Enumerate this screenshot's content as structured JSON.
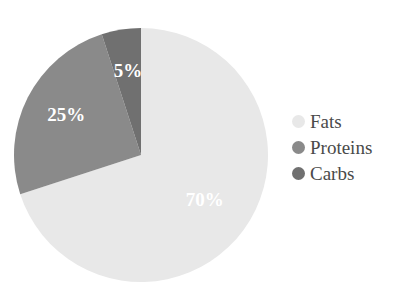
{
  "chart_data": {
    "type": "pie",
    "title": "",
    "labels": [
      "Fats",
      "Proteins",
      "Carbs"
    ],
    "values": [
      70,
      25,
      5
    ],
    "value_labels": [
      "70%",
      "25%",
      "5%"
    ],
    "colors": [
      "#e8e8e8",
      "#8a8a8a",
      "#707070"
    ],
    "start_angle_deg": 0,
    "direction": "clockwise",
    "legend_position": "right",
    "grid": false,
    "geometry": {
      "center_x": 141,
      "center_y": 155,
      "radius": 127
    },
    "slice_label_color": "#ffffff"
  },
  "legend": {
    "items": [
      {
        "label": "Fats",
        "color": "#e8e8e8"
      },
      {
        "label": "Proteins",
        "color": "#8a8a8a"
      },
      {
        "label": "Carbs",
        "color": "#707070"
      }
    ]
  },
  "background_color": "#ffffff"
}
